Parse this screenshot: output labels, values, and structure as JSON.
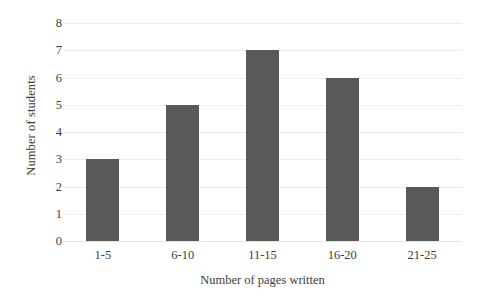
{
  "chart_data": {
    "type": "bar",
    "title": "",
    "categories": [
      "1-5",
      "6-10",
      "11-15",
      "16-20",
      "21-25"
    ],
    "values": [
      3,
      5,
      7,
      6,
      2
    ],
    "xlabel": "Number of pages written",
    "ylabel": "Number of students",
    "ylim": [
      0,
      8
    ],
    "yticks": [
      0,
      1,
      2,
      3,
      4,
      5,
      6,
      7,
      8
    ],
    "ytick_labels": [
      "0",
      "1",
      "2",
      "3",
      "4",
      "5",
      "6",
      "7",
      "8"
    ],
    "grid": "horizontal",
    "legend": "none",
    "series": [
      {
        "name": "Number of students",
        "values": [
          3,
          5,
          7,
          6,
          2
        ]
      }
    ],
    "colors": {
      "bar": "#595959",
      "gridline": "#eceded",
      "baseline": "#e3e4e5",
      "text": "#3d3d3d",
      "background": "#ffffff"
    }
  }
}
